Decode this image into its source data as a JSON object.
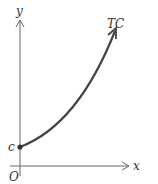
{
  "diagram": {
    "type": "line",
    "title": "",
    "axes": {
      "x_label": "x",
      "y_label": "y",
      "origin_label": "O"
    },
    "curve": {
      "label": "TC",
      "intercept_label": "c",
      "shape": "increasing convex curve starting at y-intercept c"
    },
    "colors": {
      "axis": "#555555",
      "curve": "#444444",
      "text": "#333333"
    }
  }
}
